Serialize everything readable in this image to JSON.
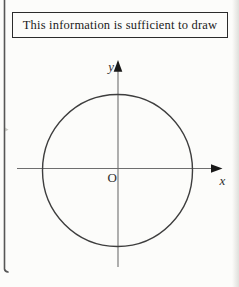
{
  "page": {
    "background": "#fcfcfa",
    "scan_shadow_color": "#78786c",
    "frame_rule_color": "#565656"
  },
  "title_box": {
    "text": "This information is sufficient to draw",
    "border_color": "#2b2b2b",
    "text_color": "#1b1b1b"
  },
  "diagram": {
    "labels": {
      "y_axis": "y",
      "x_axis": "x",
      "origin": "O"
    },
    "colors": {
      "circle": "#3e3e3e",
      "axis": "#6e6e6e",
      "arrow": "#191919",
      "label": "#2e2e2e"
    }
  }
}
